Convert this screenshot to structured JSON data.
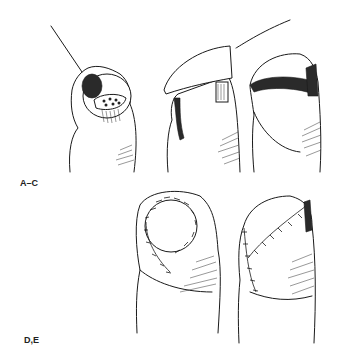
{
  "figure": {
    "panel_labels": [
      {
        "id": "upper",
        "text": "A–C"
      },
      {
        "id": "lower",
        "text": "D,E"
      }
    ],
    "panels": [
      {
        "id": "A",
        "subject": "fingertip with exposed bone and needle/probe"
      },
      {
        "id": "B",
        "subject": "fingertip with nail flap lifted by instrument"
      },
      {
        "id": "C",
        "subject": "fingertip with nail flap replaced"
      },
      {
        "id": "D",
        "subject": "fingertip with circular sutured graft"
      },
      {
        "id": "E",
        "subject": "fingertip with sutured oblique flap"
      }
    ],
    "colors": {
      "ink": "#1a1a1a",
      "background": "#ffffff"
    }
  }
}
